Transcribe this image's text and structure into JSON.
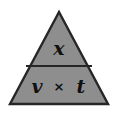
{
  "figure": {
    "name": "formula-triangle",
    "fill_color": "#8e8e8e",
    "outline_color": "#262626",
    "divider_color": "#262626",
    "background_color": "#ffffff",
    "text_color": "#101010"
  },
  "triangle": {
    "apex": {
      "x": 59,
      "y": 12
    },
    "bottom_left": {
      "x": 10,
      "y": 104
    },
    "bottom_right": {
      "x": 108,
      "y": 104
    },
    "divider_y": 66,
    "divider_left_x": 27,
    "divider_right_x": 91
  },
  "top_section": {
    "label": "x"
  },
  "bottom_section": {
    "left_label": "v",
    "operator": "×",
    "right_label": "t"
  }
}
